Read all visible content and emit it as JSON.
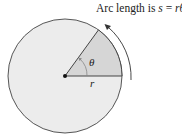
{
  "diagram": {
    "caption_prefix": "Arc length is ",
    "caption_var_s": "s",
    "caption_eq": " = ",
    "caption_var_r": "r",
    "caption_theta": "θ",
    "caption_suffix": ".",
    "angle_label": "θ",
    "radius_label": "r",
    "colors": {
      "disk_fill": "#ececec",
      "sector_fill": "#d6d6d6",
      "stroke": "#444444"
    }
  }
}
